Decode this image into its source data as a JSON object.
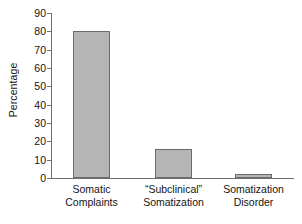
{
  "chart_data": {
    "type": "bar",
    "title": "",
    "xlabel": "",
    "ylabel": "Percentage",
    "categories": [
      "Somatic\nComplaints",
      "“Subclinical”\nSomatization",
      "Somatization\nDisorder"
    ],
    "values": [
      80,
      16,
      2
    ],
    "ylim": [
      0,
      90
    ],
    "yticks": [
      0,
      10,
      20,
      30,
      40,
      50,
      60,
      70,
      80,
      90
    ],
    "ytick_labels": [
      "0",
      "10",
      "20",
      "30",
      "40",
      "50",
      "60",
      "70",
      "80",
      "90"
    ],
    "grid": false,
    "legend": null,
    "bar_color": "#b5b5b5",
    "bar_edge_color": "#6b6b6b",
    "axis_color": "#6e6e6e"
  }
}
